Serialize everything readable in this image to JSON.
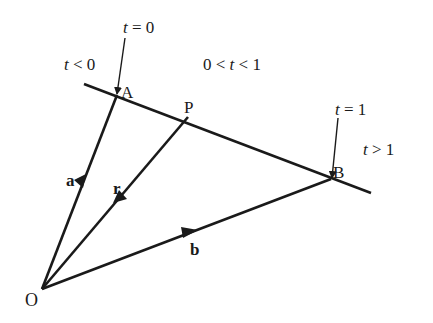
{
  "diagram": {
    "type": "vector line parametrization",
    "points": {
      "O": {
        "label": "O"
      },
      "A": {
        "label": "A"
      },
      "P": {
        "label": "P"
      },
      "B": {
        "label": "B"
      }
    },
    "vectors": {
      "a": {
        "label": "a",
        "from": "O",
        "to": "A"
      },
      "r": {
        "label": "r",
        "from": "O",
        "to": "P"
      },
      "b": {
        "label": "b",
        "from": "O",
        "to": "B"
      }
    },
    "regions": {
      "t_lt_0": {
        "var": "t",
        "rel": " < 0"
      },
      "t_between": {
        "pre": "0 < ",
        "var": "t",
        "rel": " < 1"
      },
      "t_gt_1": {
        "var": "t",
        "rel": " > 1"
      }
    },
    "markers": {
      "t_eq_0": {
        "var": "t",
        "rel": " = 0"
      },
      "t_eq_1": {
        "var": "t",
        "rel": " = 1"
      }
    },
    "line_color": "#1a1a1a"
  }
}
